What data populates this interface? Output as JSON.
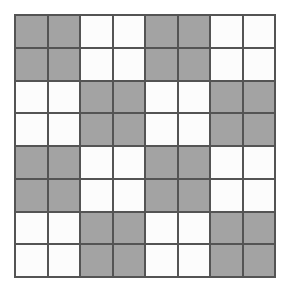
{
  "figure": {
    "name": "checkerboard-grid",
    "rows": 8,
    "columns": 8,
    "block_size": 2,
    "colors": {
      "filled": "#a3a3a3",
      "empty": "#fcfcfc",
      "gridline": "#545454",
      "background": "#ffffff"
    },
    "legend": {
      "filled_label": "shaded",
      "empty_label": "unshaded"
    },
    "counts": {
      "filled_cells": 32,
      "empty_cells": 32,
      "total_cells": 64
    },
    "cells": [
      [
        1,
        1,
        0,
        0,
        1,
        1,
        0,
        0
      ],
      [
        1,
        1,
        0,
        0,
        1,
        1,
        0,
        0
      ],
      [
        0,
        0,
        1,
        1,
        0,
        0,
        1,
        1
      ],
      [
        0,
        0,
        1,
        1,
        0,
        0,
        1,
        1
      ],
      [
        1,
        1,
        0,
        0,
        1,
        1,
        0,
        0
      ],
      [
        1,
        1,
        0,
        0,
        1,
        1,
        0,
        0
      ],
      [
        0,
        0,
        1,
        1,
        0,
        0,
        1,
        1
      ],
      [
        0,
        0,
        1,
        1,
        0,
        0,
        1,
        1
      ]
    ]
  }
}
